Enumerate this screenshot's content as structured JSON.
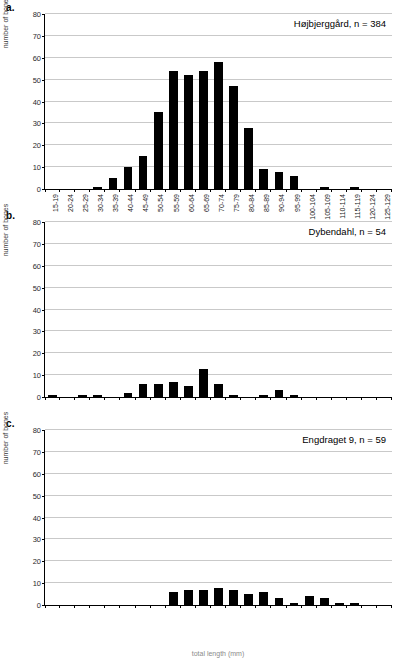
{
  "figure": {
    "ylabel": "number of bones",
    "xlabel": "total length (mm)",
    "yticks": [
      0,
      10,
      20,
      30,
      40,
      50,
      60,
      70,
      80
    ],
    "categories": [
      "15-19",
      "20-24",
      "25-29",
      "30-34",
      "35-39",
      "40-44",
      "45-49",
      "50-54",
      "55-59",
      "60-64",
      "65-69",
      "70-74",
      "75-79",
      "80-84",
      "85-89",
      "90-94",
      "95-99",
      "100-104",
      "105-109",
      "110-114",
      "115-119",
      "120-124",
      "125-129"
    ],
    "bar_color": "#000000",
    "grid_color": "#c9c9c9",
    "axis_color": "#000000"
  },
  "panels": [
    {
      "letter": "a.",
      "title": "Højbjerggård, n = 384",
      "site": "Højbjerggård",
      "n": 384
    },
    {
      "letter": "b.",
      "title": "Dybendahl, n = 54",
      "site": "Dybendahl",
      "n": 54
    },
    {
      "letter": "c.",
      "title": "Engdraget 9, n = 59",
      "site": "Engdraget 9",
      "n": 59
    }
  ],
  "chart_data": [
    {
      "type": "bar",
      "title": "Højbjerggård, n = 384",
      "panel": "a.",
      "xlabel": "total length (mm)",
      "ylabel": "number of bones",
      "ylim": [
        0,
        80
      ],
      "ytick_step": 10,
      "grid": true,
      "legend": "none",
      "categories": [
        "15-19",
        "20-24",
        "25-29",
        "30-34",
        "35-39",
        "40-44",
        "45-49",
        "50-54",
        "55-59",
        "60-64",
        "65-69",
        "70-74",
        "75-79",
        "80-84",
        "85-89",
        "90-94",
        "95-99",
        "100-104",
        "105-109",
        "110-114",
        "115-119",
        "120-124",
        "125-129"
      ],
      "values": [
        0,
        0,
        0,
        1,
        5,
        10,
        15,
        35,
        54,
        52,
        54,
        58,
        47,
        28,
        9,
        8,
        6,
        0,
        1,
        0,
        1,
        0,
        0
      ]
    },
    {
      "type": "bar",
      "title": "Dybendahl, n = 54",
      "panel": "b.",
      "xlabel": "total length (mm)",
      "ylabel": "number of bones",
      "ylim": [
        0,
        80
      ],
      "ytick_step": 10,
      "grid": true,
      "legend": "none",
      "categories": [
        "15-19",
        "20-24",
        "25-29",
        "30-34",
        "35-39",
        "40-44",
        "45-49",
        "50-54",
        "55-59",
        "60-64",
        "65-69",
        "70-74",
        "75-79",
        "80-84",
        "85-89",
        "90-94",
        "95-99",
        "100-104",
        "105-109",
        "110-114",
        "115-119",
        "120-124",
        "125-129"
      ],
      "values": [
        1,
        0,
        1,
        1,
        0,
        2,
        6,
        6,
        7,
        5,
        13,
        6,
        1,
        0,
        1,
        3,
        1,
        0,
        0,
        0,
        0,
        0,
        0
      ]
    },
    {
      "type": "bar",
      "title": "Engdraget 9, n = 59",
      "panel": "c.",
      "xlabel": "total length (mm)",
      "ylabel": "number of bones",
      "ylim": [
        0,
        80
      ],
      "ytick_step": 10,
      "grid": true,
      "legend": "none",
      "categories": [
        "15-19",
        "20-24",
        "25-29",
        "30-34",
        "35-39",
        "40-44",
        "45-49",
        "50-54",
        "55-59",
        "60-64",
        "65-69",
        "70-74",
        "75-79",
        "80-84",
        "85-89",
        "90-94",
        "95-99",
        "100-104",
        "105-109",
        "110-114",
        "115-119",
        "120-124",
        "125-129"
      ],
      "values": [
        0,
        0,
        0,
        0,
        0,
        0,
        0,
        0,
        6,
        7,
        7,
        8,
        7,
        5,
        6,
        3,
        1,
        4,
        3,
        1,
        1,
        0,
        0
      ]
    }
  ]
}
